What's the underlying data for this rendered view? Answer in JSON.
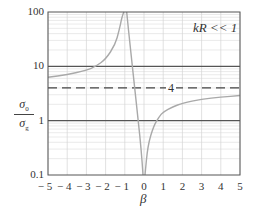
{
  "chart_data": {
    "type": "line",
    "title": "",
    "annotation": "kR << 1",
    "xlabel": "β",
    "ylabel": "σ0 / σg",
    "ylabel_num": "σ",
    "ylabel_num_sub": "0",
    "ylabel_den": "σ",
    "ylabel_den_sub": "g",
    "yscale": "log",
    "xlim": [
      -5,
      5
    ],
    "ylim": [
      0.1,
      100
    ],
    "x_ticks": [
      "− 5",
      "− 4",
      "− 3",
      "− 2",
      "− 1",
      "0",
      "1",
      "2",
      "3",
      "4",
      "5"
    ],
    "y_ticks": [
      "0.1",
      "1",
      "10",
      "100"
    ],
    "grid": true,
    "reference_line": {
      "value": 4,
      "style": "dashed",
      "label": "4"
    },
    "series": [
      {
        "name": "sigma0/sigmag (beta < -1 branch)",
        "x": [
          -5,
          -4,
          -3,
          -2.5,
          -2,
          -1.5,
          -1.3,
          -1.15,
          -1.05
        ],
        "y": [
          6.3,
          7.0,
          8.5,
          10.0,
          13.5,
          25,
          45,
          80,
          100
        ]
      },
      {
        "name": "sigma0/sigmag (-1 < beta < 0 branch)",
        "x": [
          -0.9,
          -0.7,
          -0.5,
          -0.3,
          -0.15,
          -0.05
        ],
        "y": [
          100,
          20,
          4.5,
          1.0,
          0.3,
          0.1
        ]
      },
      {
        "name": "sigma0/sigmag (beta > 0 branch)",
        "x": [
          0.05,
          0.2,
          0.5,
          0.8,
          1,
          1.5,
          2,
          3,
          4,
          5
        ],
        "y": [
          0.1,
          0.35,
          0.8,
          1.2,
          1.45,
          1.8,
          2.1,
          2.5,
          2.7,
          2.9
        ]
      }
    ]
  }
}
